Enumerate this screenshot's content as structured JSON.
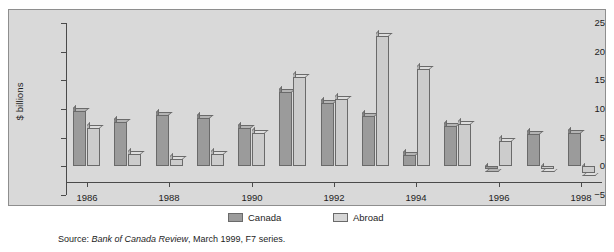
{
  "figure": {
    "title_sliver": "Chart 4: Net new equity issued by Canadian corporations",
    "source_prefix": "Source: ",
    "source_italic": "Bank of Canada Review",
    "source_suffix": ", March 1999, F7 series.",
    "panel_color": "#d9d9d9",
    "canada_color": "#9b9b9b",
    "abroad_color": "#cccccc"
  },
  "chart_data": {
    "type": "bar",
    "title": "",
    "xlabel": "",
    "ylabel": "$ billions",
    "ylim": [
      -5,
      25
    ],
    "yticks": [
      25,
      20,
      15,
      10,
      5,
      0,
      -5
    ],
    "ytick_labels": [
      "25",
      "20",
      "15",
      "10",
      "5",
      "0",
      "−5"
    ],
    "grid": false,
    "legend_position": "bottom-center",
    "categories": [
      1986,
      1987,
      1988,
      1989,
      1990,
      1991,
      1992,
      1993,
      1994,
      1995,
      1996,
      1997,
      1998
    ],
    "xtick_labels": [
      "1986",
      "1988",
      "1990",
      "1992",
      "1994",
      "1996",
      "1998"
    ],
    "xtick_categories": [
      1986,
      1988,
      1990,
      1992,
      1994,
      1996,
      1998
    ],
    "series": [
      {
        "name": "Canada",
        "color": "#9b9b9b",
        "values": [
          9.6,
          7.8,
          9.0,
          8.5,
          6.6,
          13.0,
          11.0,
          8.8,
          1.9,
          7.1,
          -0.4,
          5.7,
          5.9
        ]
      },
      {
        "name": "Abroad",
        "color": "#cccccc",
        "values": [
          6.6,
          2.2,
          1.2,
          2.1,
          5.9,
          15.5,
          11.7,
          22.8,
          17.0,
          7.4,
          4.5,
          -0.5,
          -1.1
        ]
      }
    ]
  }
}
